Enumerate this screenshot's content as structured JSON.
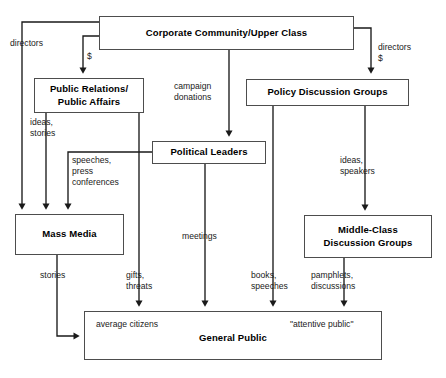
{
  "diagram": {
    "background_color": "#ffffff",
    "line_color": "#1a1a1a",
    "box_border_color": "#4d4d4d",
    "text_color": "#000000",
    "nodes": [
      {
        "id": "corporate",
        "label_lines": [
          "Corporate Community/Upper Class"
        ]
      },
      {
        "id": "public_relations",
        "label_lines": [
          "Public Relations/",
          "Public Affairs"
        ]
      },
      {
        "id": "policy_groups",
        "label_lines": [
          "Policy Discussion Groups"
        ]
      },
      {
        "id": "political_leaders",
        "label_lines": [
          "Political Leaders"
        ]
      },
      {
        "id": "mass_media",
        "label_lines": [
          "Mass Media"
        ]
      },
      {
        "id": "middle_class",
        "label_lines": [
          "Middle-Class",
          "Discussion Groups"
        ]
      },
      {
        "id": "general_public",
        "label_lines": [
          "General Public"
        ]
      }
    ],
    "edge_labels": [
      {
        "id": "directors-left",
        "lines": [
          "directors"
        ]
      },
      {
        "id": "dollar-left",
        "lines": [
          "$"
        ]
      },
      {
        "id": "campaign-donations",
        "lines": [
          "campaign",
          "donations"
        ]
      },
      {
        "id": "directors-right",
        "lines": [
          "directors",
          "$"
        ]
      },
      {
        "id": "ideas-stories",
        "lines": [
          "ideas,",
          "stories"
        ]
      },
      {
        "id": "speeches-press",
        "lines": [
          "speeches,",
          "press",
          "conferences"
        ]
      },
      {
        "id": "ideas-speakers",
        "lines": [
          "ideas,",
          "speakers"
        ]
      },
      {
        "id": "meetings",
        "lines": [
          "meetings"
        ]
      },
      {
        "id": "stories",
        "lines": [
          "stories"
        ]
      },
      {
        "id": "gifts-threats",
        "lines": [
          "gifts,",
          "threats"
        ]
      },
      {
        "id": "books-speeches",
        "lines": [
          "books,",
          "speeches"
        ]
      },
      {
        "id": "pamphlets-discussions",
        "lines": [
          "pamphlets,",
          "discussions"
        ]
      }
    ],
    "inner_labels": [
      {
        "id": "average-citizens",
        "text": "average citizens"
      },
      {
        "id": "attentive-public",
        "text": "\"attentive public\""
      }
    ]
  }
}
